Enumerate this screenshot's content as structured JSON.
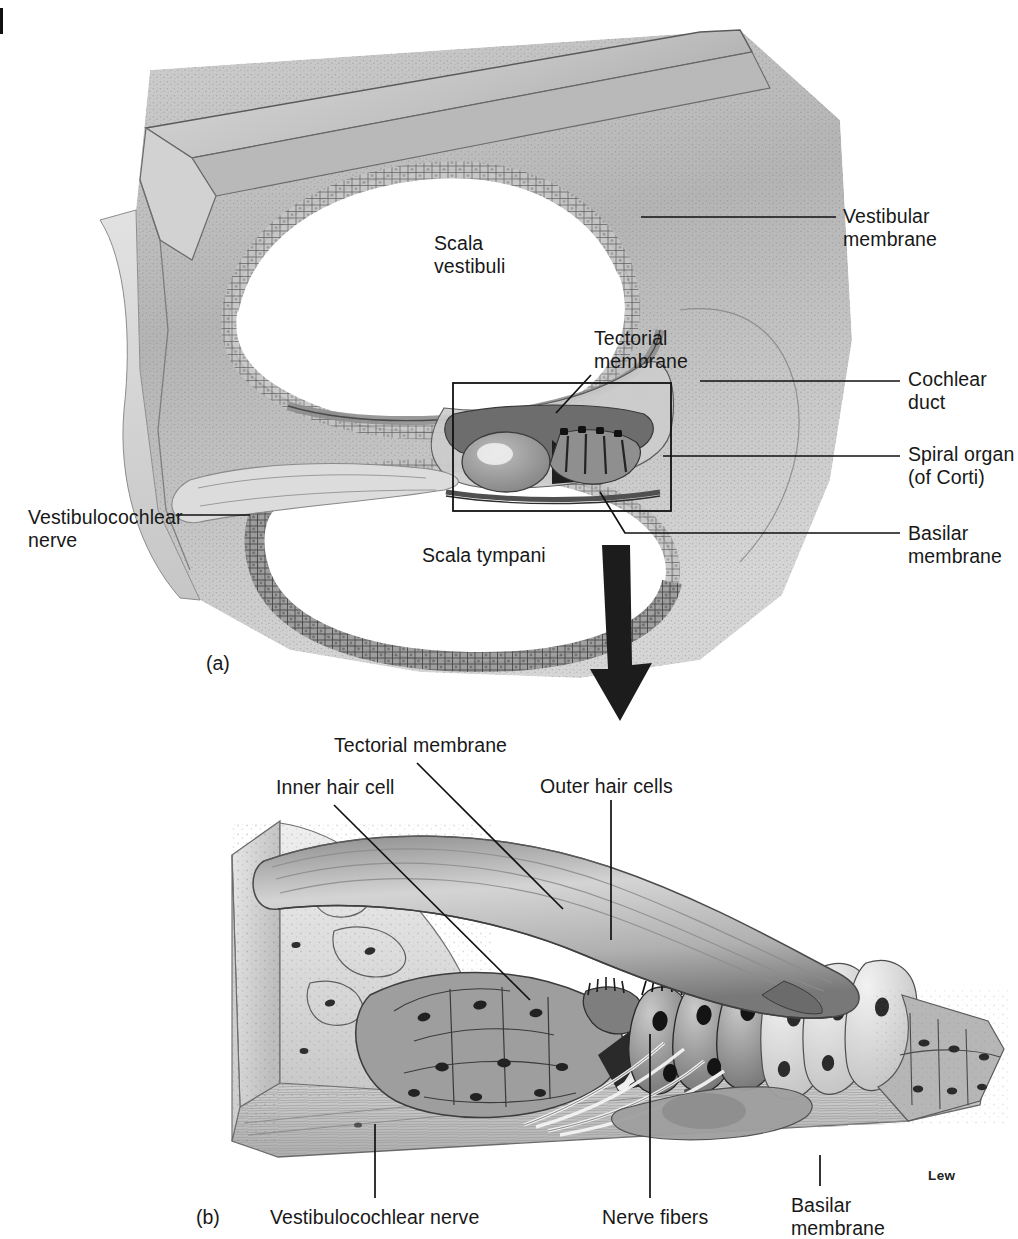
{
  "figure": {
    "signature": "Lew",
    "background_color": "#ffffff",
    "ink_color": "#181818"
  },
  "panels": [
    {
      "id": "a",
      "id_label": "(a)",
      "caption": "Cross section of the cochlear canal",
      "labels": [
        {
          "name": "scala-vestibuli",
          "text": "Scala\nvestibuli",
          "x": 434,
          "y": 232,
          "align": "left"
        },
        {
          "name": "tectorial-membrane",
          "text": "Tectorial\nmembrane",
          "x": 594,
          "y": 327,
          "align": "left"
        },
        {
          "name": "scala-tympani",
          "text": "Scala tympani",
          "x": 422,
          "y": 544,
          "align": "left"
        },
        {
          "name": "vestibular-membrane",
          "text": "Vestibular\nmembrane",
          "x": 843,
          "y": 205,
          "align": "left"
        },
        {
          "name": "cochlear-duct",
          "text": "Cochlear\nduct",
          "x": 908,
          "y": 368,
          "align": "left"
        },
        {
          "name": "spiral-organ-of-corti",
          "text": "Spiral organ\n(of Corti)",
          "x": 908,
          "y": 443,
          "align": "left"
        },
        {
          "name": "basilar-membrane",
          "text": "Basilar\nmembrane",
          "x": 908,
          "y": 522,
          "align": "left"
        },
        {
          "name": "vestibulocochlear-nerve",
          "text": "Vestibulocochlear\nnerve",
          "x": 28,
          "y": 506,
          "align": "left"
        }
      ]
    },
    {
      "id": "b",
      "id_label": "(b)",
      "caption": "Enlargement of the spiral organ (of Corti)",
      "labels": [
        {
          "name": "tectorial-membrane",
          "text": "Tectorial membrane",
          "x": 334,
          "y": 734,
          "align": "left"
        },
        {
          "name": "inner-hair-cell",
          "text": "Inner hair cell",
          "x": 276,
          "y": 776,
          "align": "left"
        },
        {
          "name": "outer-hair-cells",
          "text": "Outer hair cells",
          "x": 540,
          "y": 775,
          "align": "left"
        },
        {
          "name": "vestibulocochlear-nerve",
          "text": "Vestibulocochlear nerve",
          "x": 270,
          "y": 1206,
          "align": "left"
        },
        {
          "name": "nerve-fibers",
          "text": "Nerve fibers",
          "x": 602,
          "y": 1206,
          "align": "left"
        },
        {
          "name": "basilar-membrane",
          "text": "Basilar\nmembrane",
          "x": 791,
          "y": 1194,
          "align": "left"
        }
      ]
    }
  ],
  "annotations": {
    "detail_box": {
      "name": "detail-box",
      "x": 452,
      "y": 382,
      "width": 218,
      "height": 128
    },
    "transition_arrow": {
      "name": "zoom-arrow",
      "direction": "down",
      "x": 612,
      "y": 548,
      "length": 168
    }
  }
}
